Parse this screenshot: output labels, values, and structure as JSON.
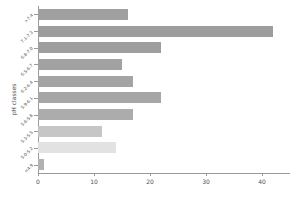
{
  "chart_data": {
    "type": "bar",
    "orientation": "horizontal",
    "title": "",
    "xlabel": "",
    "ylabel": "pH classes",
    "categories": [
      ">7.4",
      "7.1-7.3",
      "6.8-7.0",
      "6.5-6.7",
      "6.2-6.4",
      "5.9-6.1",
      "5.6-5.8",
      "5.3-5.5",
      "5.0-5.2",
      "<4.9"
    ],
    "values": [
      16,
      42,
      22,
      15,
      17,
      22,
      17,
      11.5,
      14,
      1
    ],
    "xlim": [
      0,
      45
    ],
    "xticks": [
      0,
      10,
      20,
      30,
      40
    ],
    "xtick_labels": [
      "0",
      "10",
      "20",
      "30",
      "40"
    ],
    "grid": false,
    "legend": false,
    "bar_colors": [
      "#a0a0a0",
      "#9d9d9d",
      "#9e9e9e",
      "#a2a2a2",
      "#a4a4a4",
      "#a6a6a6",
      "#acacac",
      "#c6c6c6",
      "#e2e2e2",
      "#b2b2b2"
    ],
    "axis_color": "#9a9a9a",
    "text_color": "#4f4f4f",
    "background": "#ffffff"
  }
}
